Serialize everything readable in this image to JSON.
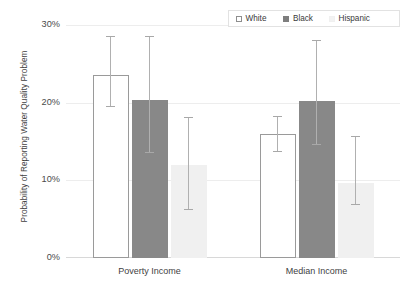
{
  "chart_data": {
    "type": "bar",
    "title": "",
    "xlabel": "",
    "ylabel": "Probability of Reporting Water Quality Problem",
    "ylim": [
      0,
      30
    ],
    "yunit": "%",
    "ytick_labels": [
      "30%",
      "20%",
      "10%",
      "0%"
    ],
    "ytick_values": [
      30,
      20,
      10,
      0
    ],
    "grid": true,
    "legend_position": "top-right",
    "categories": [
      "Poverty Income",
      "Median Income"
    ],
    "series": [
      {
        "name": "White",
        "swatch": "white-series",
        "color": "#ffffff",
        "border_color": "#9a9a9a",
        "values": [
          23.5,
          16.0
        ],
        "err_low": [
          19.5,
          13.7
        ],
        "err_high": [
          28.5,
          18.2
        ]
      },
      {
        "name": "Black",
        "swatch": "black-series",
        "color": "#888888",
        "border_color": "#888888",
        "values": [
          20.3,
          20.2
        ],
        "err_low": [
          13.5,
          14.5
        ],
        "err_high": [
          28.5,
          27.9
        ]
      },
      {
        "name": "Hispanic",
        "swatch": "hispanic-series",
        "color": "#f0f0f0",
        "border_color": "#f0f0f0",
        "values": [
          12.0,
          9.7
        ],
        "err_low": [
          6.2,
          6.8
        ],
        "err_high": [
          18.0,
          15.6
        ]
      }
    ]
  },
  "legend": {
    "items": [
      {
        "label": "White"
      },
      {
        "label": "Black"
      },
      {
        "label": "Hispanic"
      }
    ]
  }
}
